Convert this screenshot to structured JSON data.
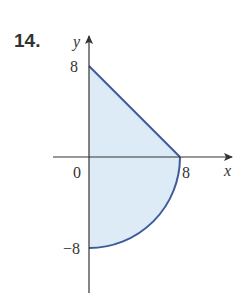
{
  "problem": {
    "number": "14."
  },
  "axes": {
    "x_label": "x",
    "y_label": "y",
    "origin_label": "0"
  },
  "ticks": {
    "y_top": "8",
    "y_bottom": "−8",
    "x_right": "8"
  },
  "region": {
    "description": "Region bounded by y-axis, line from (0,8) to (8,0), and quarter circle of radius 8 from (8,0) to (0,-8)",
    "fill_color": "#dcebf6",
    "stroke_color": "#3d5a9a"
  },
  "colors": {
    "axis": "#333333",
    "text": "#333333"
  }
}
